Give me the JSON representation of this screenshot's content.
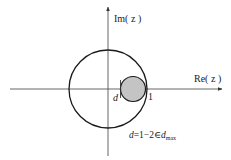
{
  "diagram": {
    "type": "complex-plane",
    "axes": {
      "x_label": "Re( z )",
      "y_label": "Im( z )"
    },
    "labels": {
      "d_marker": "d",
      "one_marker": "1",
      "equation_prefix": "d=1−2∈",
      "equation_var": "d",
      "equation_sub": "max"
    },
    "shapes": {
      "unit_circle": {
        "cx": 108,
        "cy": 89,
        "r": 39,
        "stroke": "#1a1a1a"
      },
      "stability_disc": {
        "cx": 133,
        "cy": 89,
        "r": 13,
        "fill": "#c4c4c4",
        "stroke": "#1a1a1a"
      }
    }
  }
}
